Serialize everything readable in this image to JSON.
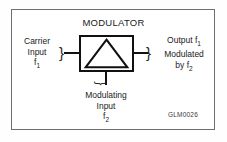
{
  "figure": {
    "title": "MODULATOR",
    "reference_code": "GLM0026",
    "colors": {
      "background": "#ffffff",
      "frame_border": "#6e6e6e",
      "symbol_stroke": "#111111",
      "text": "#1a1a1a",
      "ref_code_text": "#3a3a3a"
    }
  },
  "symbol": {
    "name": "modulator-block",
    "shape": "square-with-triangle",
    "triangle_description": "triangle with apex at top center and base on bottom edge"
  },
  "ports": {
    "left": {
      "name": "carrier-input",
      "line1": "Carrier",
      "line2": "Input",
      "line3_base": "f",
      "line3_sub": "1",
      "connector": "brace-right-facing"
    },
    "right": {
      "name": "modulated-output",
      "line1_base": "Output f",
      "line1_sub": "1",
      "line2": "Modulated",
      "line3_base": "by f",
      "line3_sub": "2",
      "connector": "brace-right-facing"
    },
    "bottom": {
      "name": "modulating-input",
      "line1": "Modulating",
      "line2": "Input",
      "line3_base": "f",
      "line3_sub": "2",
      "connector": "brace-downward"
    }
  },
  "glyphs": {
    "brace_right": "}",
    "brace_down": "}"
  }
}
